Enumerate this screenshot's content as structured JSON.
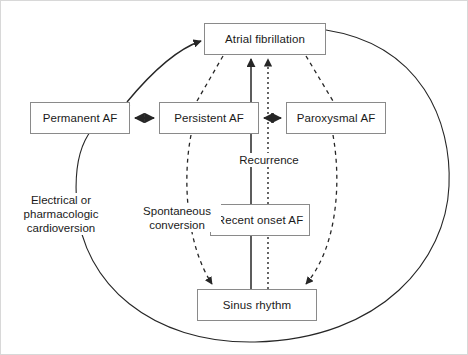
{
  "figure": {
    "background": "#ffffff",
    "frame_color": "#d8d8d8",
    "line_color": "#262626",
    "box_border_color": "#8a8a8a",
    "text_color": "#1a1a1a"
  },
  "nodes": {
    "atrial_fibrillation": "Atrial fibrillation",
    "permanent_af": "Permanent AF",
    "persistent_af": "Persistent AF",
    "paroxysmal_af": "Paroxysmal AF",
    "recent_onset_af": "Recent onset AF",
    "sinus_rhythm": "Sinus rhythm"
  },
  "edge_labels": {
    "cardioversion": "Electrical or\npharmacologic\ncardioversion",
    "spontaneous_conversion": "Spontaneous\nconversion",
    "recurrence": "Recurrence"
  },
  "edges": [
    {
      "from": "permanent_af",
      "to": "atrial_fibrillation",
      "style": "solid-curve",
      "arrow": "end"
    },
    {
      "from": "permanent_af",
      "to": "persistent_af",
      "style": "solid",
      "arrow": "both"
    },
    {
      "from": "paroxysmal_af",
      "to": "persistent_af",
      "style": "solid",
      "arrow": "both"
    },
    {
      "from": "recent_onset_af",
      "to": "atrial_fibrillation",
      "style": "solid",
      "arrow": "end",
      "label": "recurrence"
    },
    {
      "from": "sinus_rhythm",
      "to": "atrial_fibrillation",
      "style": "dotted",
      "arrow": "end"
    },
    {
      "from": "atrial_fibrillation",
      "to": "persistent_af",
      "style": "dashed",
      "arrow": "none"
    },
    {
      "from": "atrial_fibrillation",
      "to": "paroxysmal_af",
      "style": "dashed",
      "arrow": "none"
    },
    {
      "from": "persistent_af",
      "to": "sinus_rhythm",
      "style": "dashed-curve",
      "arrow": "end",
      "label": "spontaneous_conversion"
    },
    {
      "from": "paroxysmal_af",
      "to": "sinus_rhythm",
      "style": "dashed-curve",
      "arrow": "end"
    },
    {
      "from": "sinus_rhythm",
      "to": "permanent_af",
      "style": "ellipse-arc",
      "arrow": "none",
      "label": "cardioversion"
    }
  ]
}
